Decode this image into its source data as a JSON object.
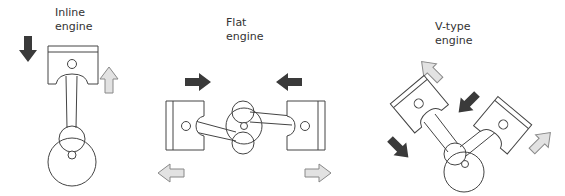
{
  "diagrams": [
    {
      "id": "inline",
      "title_line1": "Inline",
      "title_line2": "engine"
    },
    {
      "id": "flat",
      "title_line1": "Flat",
      "title_line2": "engine"
    },
    {
      "id": "v-type",
      "title_line1": "V-type",
      "title_line2": "engine"
    }
  ],
  "colors": {
    "dark_arrow": "#3a3a3a",
    "light_arrow_fill": "#e2e2e2",
    "light_arrow_stroke": "#888888",
    "outline": "#444444",
    "text": "#333333"
  }
}
